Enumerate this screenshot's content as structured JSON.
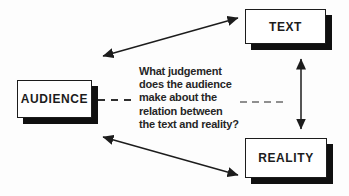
{
  "diagram": {
    "boxes": {
      "text": {
        "label": "TEXT"
      },
      "audience": {
        "label": "AUDIENCE"
      },
      "reality": {
        "label": "REALITY"
      }
    },
    "question": "What judgement\ndoes the audience\nmake about the\nrelation between\nthe text and reality?",
    "colors": {
      "ink": "#1c1c1c",
      "box_fill": "#ffffff",
      "box_shadow": "#101010",
      "background": "#fdfdfd",
      "dash_left": "#2e2e2e",
      "dash_right": "#8f8f8f"
    }
  }
}
